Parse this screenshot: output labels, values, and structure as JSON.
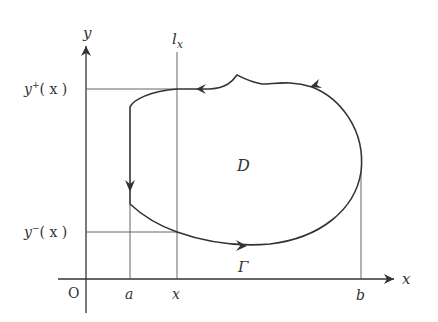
{
  "diagram": {
    "type": "region-boundary-figure",
    "colors": {
      "stroke": "#333333",
      "thin": "#555555",
      "background": "#ffffff"
    },
    "labels": {
      "origin": "O",
      "x_axis": "x",
      "y_axis": "y",
      "line_name": "l",
      "line_sub": "x",
      "upper_func_base": "y",
      "upper_func_sup": "+",
      "upper_func_arg": "( x )",
      "lower_func_base": "y",
      "lower_func_sup": "−",
      "lower_func_arg": "( x )",
      "region": "D",
      "curve": "Γ",
      "tick_a": "a",
      "tick_x": "x",
      "tick_b": "b"
    },
    "points": {
      "origin": [
        86,
        279
      ],
      "a": [
        130,
        279
      ],
      "x": [
        177,
        279
      ],
      "b": [
        361,
        279
      ],
      "upper_intersection": [
        177,
        89
      ],
      "lower_intersection": [
        177,
        232
      ],
      "cusp": [
        237,
        75
      ],
      "rightmost": [
        361,
        172
      ]
    },
    "orientation": "counterclockwise"
  }
}
